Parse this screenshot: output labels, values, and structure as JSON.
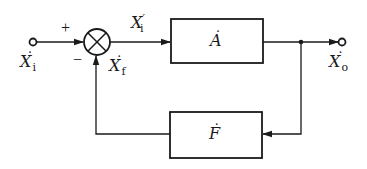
{
  "diagram": {
    "type": "negative feedback block diagram",
    "colors": {
      "stroke": "#1a1a1a",
      "background": "#ffffff"
    },
    "input": {
      "symbol": "X",
      "subscript": "i",
      "dotted": true
    },
    "summing_junction": {
      "plus_sign": "+",
      "minus_sign": "−"
    },
    "net_input": {
      "symbol": "X",
      "subscript": "i",
      "prime": "′"
    },
    "feedback_signal": {
      "symbol": "X",
      "subscript": "f",
      "dotted": true
    },
    "forward_block": {
      "symbol": "A",
      "dotted": true
    },
    "feedback_block": {
      "symbol": "F",
      "dotted": true
    },
    "output": {
      "symbol": "X",
      "subscript": "o",
      "dotted": true
    }
  }
}
